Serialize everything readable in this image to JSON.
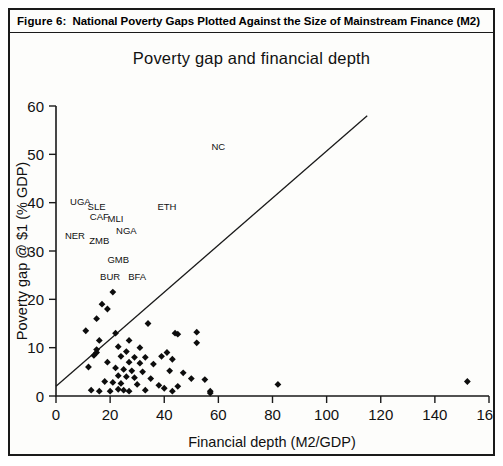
{
  "figure": {
    "number_label": "Figure 6:",
    "caption": "National Poverty Gaps Plotted Against the Size of Mainstream Finance (M2)"
  },
  "chart_data": {
    "type": "scatter",
    "title": "Poverty gap and financial depth",
    "xlabel": "Financial depth (M2/GDP)",
    "ylabel": "Poverty gap @ $1 (% GDP)",
    "xlim": [
      0,
      160
    ],
    "ylim": [
      0,
      60
    ],
    "xticks": [
      0,
      20,
      40,
      60,
      80,
      100,
      120,
      140,
      160
    ],
    "yticks": [
      0,
      10,
      20,
      30,
      40,
      50,
      60
    ],
    "grid": false,
    "legend": null,
    "legend_position": "none",
    "marker_style": "filled-diamond",
    "reference_line": {
      "label": "diagonal reference line",
      "x_start": 0,
      "y_start": 2,
      "x_end": 115,
      "y_end": 58
    },
    "annotations": [
      {
        "text": "NC",
        "x": 60,
        "y": 51
      },
      {
        "text": "UGA",
        "x": 9,
        "y": 39.5
      },
      {
        "text": "SLE",
        "x": 15,
        "y": 38.5
      },
      {
        "text": "ETH",
        "x": 41,
        "y": 38.5
      },
      {
        "text": "CAF",
        "x": 16,
        "y": 36.5
      },
      {
        "text": "MLI",
        "x": 22,
        "y": 36
      },
      {
        "text": "NGA",
        "x": 26,
        "y": 33.5
      },
      {
        "text": "NER",
        "x": 7,
        "y": 32.5
      },
      {
        "text": "ZMB",
        "x": 16,
        "y": 31.5
      },
      {
        "text": "GMB",
        "x": 23,
        "y": 27.5
      },
      {
        "text": "BUR",
        "x": 20,
        "y": 24
      },
      {
        "text": "BFA",
        "x": 30,
        "y": 24
      }
    ],
    "points": [
      {
        "x": 21,
        "y": 21.5
      },
      {
        "x": 17,
        "y": 19.0
      },
      {
        "x": 19,
        "y": 18.0
      },
      {
        "x": 15,
        "y": 16.0
      },
      {
        "x": 34,
        "y": 15.0
      },
      {
        "x": 11,
        "y": 13.5
      },
      {
        "x": 22,
        "y": 13.0
      },
      {
        "x": 44,
        "y": 13.0
      },
      {
        "x": 45,
        "y": 12.8
      },
      {
        "x": 52,
        "y": 13.2
      },
      {
        "x": 16,
        "y": 11.5
      },
      {
        "x": 27,
        "y": 11.5
      },
      {
        "x": 52,
        "y": 11.0
      },
      {
        "x": 23,
        "y": 10.2
      },
      {
        "x": 31,
        "y": 10.0
      },
      {
        "x": 15,
        "y": 9.6
      },
      {
        "x": 15,
        "y": 9.0
      },
      {
        "x": 26,
        "y": 9.2
      },
      {
        "x": 41,
        "y": 9.0
      },
      {
        "x": 14,
        "y": 8.4
      },
      {
        "x": 24,
        "y": 8.2
      },
      {
        "x": 29,
        "y": 8.0
      },
      {
        "x": 33,
        "y": 8.0
      },
      {
        "x": 39,
        "y": 8.2
      },
      {
        "x": 43,
        "y": 7.6
      },
      {
        "x": 19,
        "y": 7.0
      },
      {
        "x": 27,
        "y": 7.0
      },
      {
        "x": 31,
        "y": 6.8
      },
      {
        "x": 36,
        "y": 6.6
      },
      {
        "x": 12,
        "y": 6.0
      },
      {
        "x": 22,
        "y": 5.8
      },
      {
        "x": 25,
        "y": 5.5
      },
      {
        "x": 28,
        "y": 5.2
      },
      {
        "x": 32,
        "y": 5.0
      },
      {
        "x": 42,
        "y": 5.2
      },
      {
        "x": 47,
        "y": 4.8
      },
      {
        "x": 23,
        "y": 4.2
      },
      {
        "x": 26,
        "y": 4.0
      },
      {
        "x": 29,
        "y": 3.8
      },
      {
        "x": 35,
        "y": 3.6
      },
      {
        "x": 50,
        "y": 3.6
      },
      {
        "x": 55,
        "y": 3.4
      },
      {
        "x": 18,
        "y": 3.0
      },
      {
        "x": 21,
        "y": 2.8
      },
      {
        "x": 24,
        "y": 2.6
      },
      {
        "x": 30,
        "y": 2.4
      },
      {
        "x": 38,
        "y": 2.2
      },
      {
        "x": 45,
        "y": 2.0
      },
      {
        "x": 13,
        "y": 1.2
      },
      {
        "x": 16,
        "y": 1.0
      },
      {
        "x": 20,
        "y": 1.0
      },
      {
        "x": 23,
        "y": 1.4
      },
      {
        "x": 25,
        "y": 1.2
      },
      {
        "x": 27,
        "y": 1.0
      },
      {
        "x": 33,
        "y": 1.2
      },
      {
        "x": 40,
        "y": 1.6
      },
      {
        "x": 43,
        "y": 1.0
      },
      {
        "x": 57,
        "y": 1.0
      },
      {
        "x": 57,
        "y": 0.6
      },
      {
        "x": 82,
        "y": 2.4
      },
      {
        "x": 152,
        "y": 3.0
      }
    ]
  }
}
